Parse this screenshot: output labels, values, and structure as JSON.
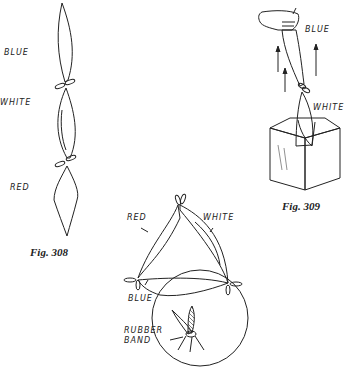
{
  "figures": [
    {
      "id": "fig308",
      "caption": "Fig. 308",
      "labels": [
        "BLUE",
        "WHITE",
        "RED"
      ]
    },
    {
      "id": "fig309",
      "caption": "Fig. 309",
      "labels": [
        "BLUE",
        "WHITE"
      ]
    },
    {
      "id": "fig310",
      "caption": "",
      "labels": [
        "RED",
        "WHITE",
        "BLUE",
        "RUBBER",
        "BAND"
      ]
    }
  ],
  "colors": {
    "ink": "#222222",
    "background": "#ffffff"
  }
}
